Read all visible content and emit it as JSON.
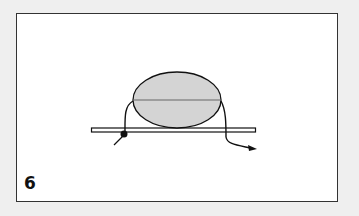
{
  "figure": {
    "step_number": "6",
    "colors": {
      "background": "#efefef",
      "panel": "#ffffff",
      "frame": "#333333",
      "bead_fill": "#d4d4d4",
      "line": "#111111"
    }
  }
}
